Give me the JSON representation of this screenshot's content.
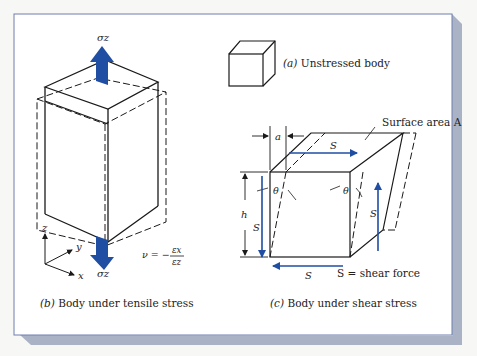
{
  "colors": {
    "page_bg": "#f7f8f5",
    "frame_bg": "#ffffff",
    "frame_border": "#6d7fae",
    "frame_shadow": "#aab3c6",
    "arrow_blue": "#1f4ea3",
    "line": "#1a1a1a"
  },
  "panel_a": {
    "caption_prefix": "(a)",
    "caption_text": " Unstressed body"
  },
  "panel_b": {
    "caption_prefix": "(b)",
    "caption_text": " Body under tensile stress",
    "top_force_label": "σz",
    "bottom_force_label": "σz",
    "axes": {
      "z": "z",
      "y": "y",
      "x": "x"
    },
    "formula": {
      "lhs": "ν = −",
      "numerator": "εx",
      "denominator": "εz"
    }
  },
  "panel_c": {
    "caption_prefix": "(c)",
    "caption_text": " Body under shear stress",
    "surface_label": "Surface area A",
    "offset_label": "a",
    "height_label": "h",
    "angle_label_left": "θ",
    "angle_label_right": "θ",
    "force_top": "S",
    "force_left": "S",
    "force_right": "S",
    "force_bottom": "S",
    "legend": "S = shear force"
  }
}
